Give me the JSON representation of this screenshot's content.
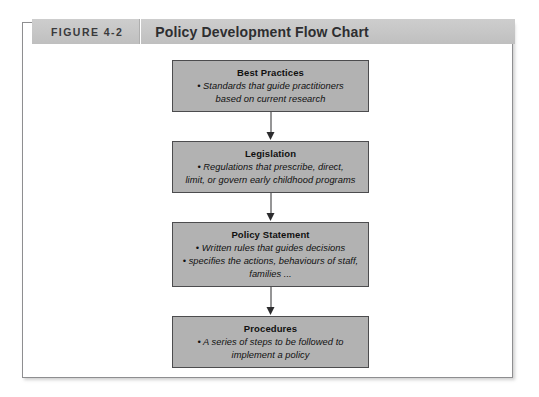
{
  "figure": {
    "number": "FIGURE 4-2",
    "title": "Policy Development Flow Chart"
  },
  "flow_chart": {
    "nodes": [
      {
        "title": "Best Practices",
        "bullets": [
          "• Standards that guide practitioners",
          "based on current research"
        ]
      },
      {
        "title": "Legislation",
        "bullets": [
          "• Regulations that prescribe, direct,",
          "limit, or govern early childhood programs"
        ]
      },
      {
        "title": "Policy Statement",
        "bullets": [
          "• Written rules that guides decisions",
          "• specifies the actions, behaviours of staff,",
          "families ..."
        ]
      },
      {
        "title": "Procedures",
        "bullets": [
          "• A series of steps to be followed to",
          "implement a policy"
        ]
      }
    ],
    "arrows": [
      {
        "name": "arrow-best-practices-to-legislation"
      },
      {
        "name": "arrow-legislation-to-policy-statement"
      },
      {
        "name": "arrow-policy-statement-to-procedures"
      }
    ]
  }
}
